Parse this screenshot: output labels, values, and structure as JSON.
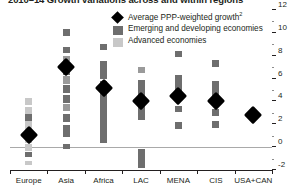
{
  "chart_data": {
    "type": "bar",
    "title": "2010–14 Growth variations across and within regions",
    "title_footnote": "1",
    "xlabel": "",
    "ylabel": "",
    "ylim": [
      -2,
      12
    ],
    "ytick_step": 2,
    "yticks": [
      -2,
      0,
      2,
      4,
      6,
      8,
      10,
      12
    ],
    "ytick_labels": [
      "-2",
      "0",
      "2",
      "4",
      "6",
      "8",
      "10",
      "12"
    ],
    "minor_tick_step": 1,
    "grid": false,
    "zero_line": 0,
    "axis_position": "right",
    "legend_position": "top-center",
    "categories": [
      "Europe",
      "Asia",
      "Africa",
      "LAC",
      "MENA",
      "CIS",
      "USA+CAN"
    ],
    "series": [
      {
        "name": "Average PPP-weighted growth",
        "marker": "diamond",
        "color": "#000000",
        "values": [
          1.1,
          7.0,
          5.2,
          4.0,
          4.5,
          4.0,
          2.8
        ]
      },
      {
        "name": "Country growth range",
        "type": "stacked-country-segments",
        "groups": [
          {
            "category": "Europe",
            "economy_type": "Advanced economies",
            "color": "#c8c8c8",
            "range": [
              -1.6,
              4.3
            ],
            "segments": [
              {
                "low": 3.7,
                "high": 4.3,
                "color": "#c8c8c8"
              },
              {
                "low": 2.9,
                "high": 3.5,
                "color": "#c8c8c8"
              },
              {
                "low": 2.3,
                "high": 2.9,
                "color": "#6e6e6e"
              },
              {
                "low": 1.7,
                "high": 2.3,
                "color": "#c8c8c8"
              },
              {
                "low": 1.1,
                "high": 1.7,
                "color": "#c8c8c8"
              },
              {
                "low": 0.4,
                "high": 1.1,
                "color": "#c8c8c8"
              },
              {
                "low": -0.3,
                "high": 0.3,
                "color": "#c8c8c8"
              },
              {
                "low": -0.9,
                "high": -0.4,
                "color": "#6e6e6e"
              },
              {
                "low": -1.6,
                "high": -1.2,
                "color": "#c8c8c8"
              }
            ]
          },
          {
            "category": "Asia",
            "economy_type": "Emerging and developing economies",
            "color": "#6e6e6e",
            "range": [
              -0.2,
              10.3
            ],
            "segments": [
              {
                "low": 9.7,
                "high": 10.3,
                "color": "#6e6e6e"
              },
              {
                "low": 8.2,
                "high": 8.8,
                "color": "#6e6e6e"
              },
              {
                "low": 7.5,
                "high": 8.0,
                "color": "#9a9a9a"
              },
              {
                "low": 6.3,
                "high": 7.4,
                "color": "#6e6e6e"
              },
              {
                "low": 5.5,
                "high": 6.2,
                "color": "#9a9a9a"
              },
              {
                "low": 4.7,
                "high": 5.4,
                "color": "#6e6e6e"
              },
              {
                "low": 3.9,
                "high": 4.6,
                "color": "#6e6e6e"
              },
              {
                "low": 3.2,
                "high": 3.8,
                "color": "#9a9a9a"
              },
              {
                "low": 2.2,
                "high": 2.9,
                "color": "#6e6e6e"
              },
              {
                "low": 0.9,
                "high": 1.9,
                "color": "#6e6e6e"
              },
              {
                "low": -0.2,
                "high": 0.3,
                "color": "#6e6e6e"
              }
            ]
          },
          {
            "category": "Africa",
            "economy_type": "Emerging and developing economies",
            "color": "#6e6e6e",
            "range": [
              0.2,
              9.0
            ],
            "segments": [
              {
                "low": 8.5,
                "high": 9.0,
                "color": "#6e6e6e"
              },
              {
                "low": 6.0,
                "high": 7.5,
                "color": "#6e6e6e"
              },
              {
                "low": 0.4,
                "high": 5.8,
                "color": "#6e6e6e"
              }
            ]
          },
          {
            "category": "LAC",
            "economy_type": "Emerging and developing economies",
            "color": "#6e6e6e",
            "range": [
              -1.8,
              7.0
            ],
            "segments": [
              {
                "low": 6.5,
                "high": 7.0,
                "color": "#9a9a9a"
              },
              {
                "low": 2.4,
                "high": 5.9,
                "color": "#6e6e6e"
              },
              {
                "low": -1.8,
                "high": -0.2,
                "color": "#6e6e6e"
              }
            ]
          },
          {
            "category": "MENA",
            "economy_type": "Emerging and developing economies",
            "color": "#6e6e6e",
            "range": [
              1.6,
              8.4
            ],
            "segments": [
              {
                "low": 7.9,
                "high": 8.4,
                "color": "#6e6e6e"
              },
              {
                "low": 4.5,
                "high": 6.3,
                "color": "#6e6e6e"
              },
              {
                "low": 3.1,
                "high": 3.6,
                "color": "#6e6e6e"
              },
              {
                "low": 1.6,
                "high": 2.2,
                "color": "#6e6e6e"
              }
            ]
          },
          {
            "category": "CIS",
            "economy_type": "Emerging and developing economies",
            "color": "#6e6e6e",
            "range": [
              1.7,
              7.6
            ],
            "segments": [
              {
                "low": 7.0,
                "high": 7.6,
                "color": "#6e6e6e"
              },
              {
                "low": 4.3,
                "high": 5.8,
                "color": "#6e6e6e"
              },
              {
                "low": 2.7,
                "high": 3.3,
                "color": "#6e6e6e"
              },
              {
                "low": 1.7,
                "high": 2.3,
                "color": "#6e6e6e"
              }
            ]
          },
          {
            "category": "USA+CAN",
            "economy_type": "Advanced economies",
            "color": "#c8c8c8",
            "range": [
              2.6,
              3.0
            ],
            "segments": []
          }
        ]
      }
    ]
  },
  "legend": {
    "items": [
      {
        "label": "Average PPP-weighted growth",
        "footnote": "2",
        "mark": "diamond",
        "color": "#000000"
      },
      {
        "label": "Emerging and developing economies",
        "footnote": "",
        "mark": "swatch",
        "color": "#6e6e6e"
      },
      {
        "label": "Advanced economies",
        "footnote": "",
        "mark": "swatch",
        "color": "#c8c8c8"
      }
    ]
  },
  "colors": {
    "advanced": "#c8c8c8",
    "emerging": "#6e6e6e",
    "average_marker": "#000000",
    "axis": "#231f20",
    "zero_line": "#a9a9a9"
  }
}
